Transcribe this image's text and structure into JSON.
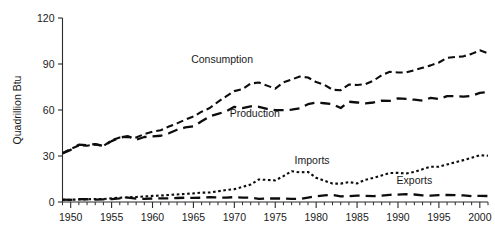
{
  "chart_data": {
    "type": "line",
    "title": "",
    "xlabel": "",
    "ylabel": "Quadrillion Btu",
    "xlim": [
      1949,
      2001
    ],
    "ylim": [
      0,
      120
    ],
    "grid": false,
    "legend_position": "inline-annotations",
    "y_ticks": [
      0,
      30,
      60,
      90,
      120
    ],
    "y_tick_labels": [
      "0",
      "30",
      "60",
      "90",
      "120"
    ],
    "x_ticks": [
      1950,
      1955,
      1960,
      1965,
      1970,
      1975,
      1980,
      1985,
      1990,
      1995,
      2000
    ],
    "x_tick_labels": [
      "1950",
      "1955",
      "1960",
      "1965",
      "1970",
      "1975",
      "1980",
      "1985",
      "1990",
      "1995",
      "2000"
    ],
    "x_minor_tick_step": 1,
    "x": [
      1949,
      1950,
      1951,
      1952,
      1953,
      1954,
      1955,
      1956,
      1957,
      1958,
      1959,
      1960,
      1961,
      1962,
      1963,
      1964,
      1965,
      1966,
      1967,
      1968,
      1969,
      1970,
      1971,
      1972,
      1973,
      1974,
      1975,
      1976,
      1977,
      1978,
      1979,
      1980,
      1981,
      1982,
      1983,
      1984,
      1985,
      1986,
      1987,
      1988,
      1989,
      1990,
      1991,
      1992,
      1993,
      1994,
      1995,
      1996,
      1997,
      1998,
      1999,
      2000,
      2001
    ],
    "series": [
      {
        "name": "Consumption",
        "line_style": "dashed",
        "color": "#0d0d0d",
        "label_x": 1968.5,
        "label_y": 90.5,
        "values": [
          31.9,
          34.6,
          36.9,
          36.7,
          37.6,
          36.6,
          40.2,
          42.1,
          42.5,
          42.1,
          44.3,
          45.8,
          46.8,
          49.2,
          51.3,
          53.7,
          55.7,
          58.9,
          61.3,
          65.3,
          68.9,
          72.3,
          73.6,
          77.3,
          77.9,
          75.9,
          73.9,
          78.0,
          79.9,
          81.8,
          81.2,
          78.2,
          76.4,
          73.2,
          72.9,
          76.6,
          76.3,
          76.8,
          79.1,
          82.7,
          84.9,
          84.5,
          84.5,
          86.0,
          87.5,
          89.1,
          91.0,
          94.0,
          94.6,
          95.0,
          96.6,
          98.9,
          97.0
        ]
      },
      {
        "name": "Production",
        "line_style": "long-dashed",
        "color": "#0d0d0d",
        "label_x": 1972.5,
        "label_y": 55.5,
        "values": [
          31.7,
          34.0,
          37.4,
          37.1,
          37.8,
          36.5,
          39.7,
          42.0,
          42.9,
          40.6,
          42.4,
          42.8,
          43.2,
          44.8,
          47.1,
          48.6,
          49.3,
          52.6,
          55.9,
          57.5,
          59.1,
          62.1,
          61.3,
          62.4,
          62.1,
          60.8,
          59.9,
          59.9,
          60.2,
          61.1,
          63.8,
          64.8,
          64.4,
          63.9,
          61.3,
          65.4,
          64.9,
          64.3,
          64.9,
          66.1,
          66.0,
          67.6,
          67.2,
          66.7,
          66.1,
          67.9,
          67.1,
          69.0,
          69.0,
          68.7,
          69.2,
          71.2,
          71.6
        ]
      },
      {
        "name": "Imports",
        "line_style": "dotted",
        "color": "#0d0d0d",
        "label_x": 1979.5,
        "label_y": 25.0,
        "values": [
          1.4,
          1.5,
          1.6,
          1.8,
          2.0,
          1.9,
          2.4,
          2.8,
          3.0,
          3.3,
          3.6,
          4.0,
          4.2,
          4.6,
          4.9,
          5.3,
          5.6,
          6.1,
          6.2,
          7.0,
          7.8,
          8.4,
          9.8,
          11.4,
          14.7,
          14.4,
          14.1,
          16.9,
          20.1,
          19.3,
          19.6,
          15.8,
          13.9,
          12.0,
          12.0,
          13.0,
          12.1,
          14.5,
          15.7,
          17.3,
          18.9,
          19.0,
          18.6,
          19.6,
          21.4,
          23.0,
          23.0,
          24.5,
          25.9,
          27.3,
          28.8,
          30.5,
          30.2
        ]
      },
      {
        "name": "Exports",
        "line_style": "long-dashed",
        "color": "#0d0d0d",
        "label_x": 1992.0,
        "label_y": 12.0,
        "values": [
          1.6,
          1.4,
          1.9,
          1.8,
          1.5,
          1.7,
          1.9,
          2.3,
          2.9,
          2.2,
          2.1,
          2.3,
          2.3,
          2.3,
          2.6,
          2.8,
          2.7,
          2.8,
          3.1,
          3.0,
          2.8,
          3.2,
          2.8,
          2.9,
          2.1,
          2.2,
          2.4,
          2.2,
          2.1,
          1.9,
          2.9,
          3.7,
          4.3,
          4.6,
          3.7,
          3.8,
          4.2,
          4.0,
          3.8,
          4.2,
          4.7,
          4.8,
          5.1,
          4.9,
          4.3,
          4.1,
          4.5,
          4.6,
          4.5,
          4.3,
          3.8,
          4.0,
          3.9
        ]
      }
    ]
  }
}
